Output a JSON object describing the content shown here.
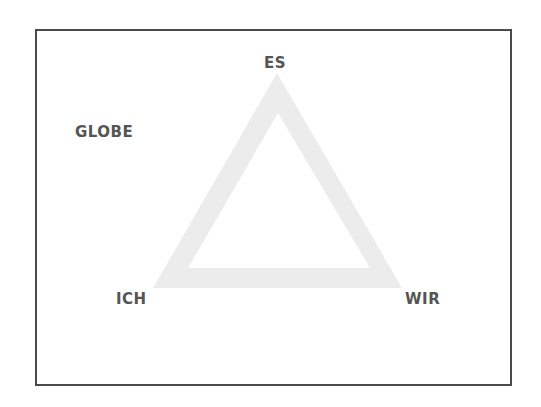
{
  "diagram": {
    "type": "triangle",
    "labels": {
      "top": "ES",
      "bottom_left": "ICH",
      "bottom_right": "WIR",
      "outside": "GLOBE"
    },
    "colors": {
      "text": "#555555",
      "triangle_fill": "#ececec",
      "frame": "#4a4a4a"
    }
  }
}
